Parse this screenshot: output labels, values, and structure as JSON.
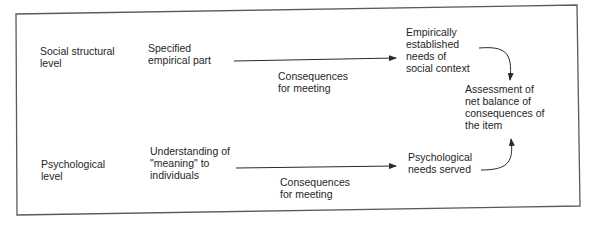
{
  "diagram": {
    "levels": {
      "social": "Social structural\nlevel",
      "psychological": "Psychological\nlevel"
    },
    "nodes": {
      "specified_part": "Specified\nempirical part",
      "understanding_meaning": "Understanding of\n\"meaning\" to\nindividuals",
      "social_needs": "Empirically\nestablished\nneeds of\nsocial context",
      "psych_needs": "Psychological\nneeds served",
      "assessment": "Assessment of\nnet balance of\nconsequences of\nthe item"
    },
    "edges": {
      "top_label": "Consequences\nfor meeting",
      "bottom_label": "Consequences\nfor meeting"
    },
    "colors": {
      "line": "#2a2a2a",
      "border": "#555555",
      "background": "#ffffff"
    }
  }
}
